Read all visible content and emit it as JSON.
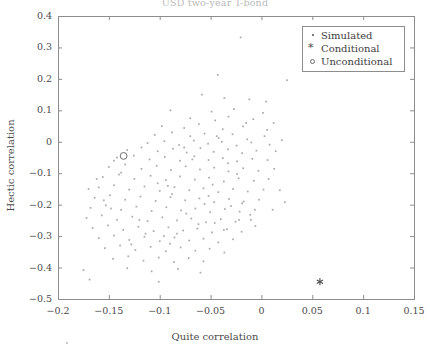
{
  "chart_data": {
    "type": "scatter",
    "title": "USD two-year T-bond",
    "xlabel": "Quite correlation",
    "ylabel": "Hectic correlation",
    "xlim": [
      -0.2,
      0.15
    ],
    "ylim": [
      -0.5,
      0.4
    ],
    "xticks": [
      -0.2,
      -0.15,
      -0.1,
      -0.05,
      0,
      0.05,
      0.1,
      0.15
    ],
    "xticklabels": [
      "−0.2",
      "−0.15",
      "−0.1",
      "−0.05",
      "0",
      "0.05",
      "0.1",
      "0.15"
    ],
    "yticks": [
      -0.5,
      -0.4,
      -0.3,
      -0.2,
      -0.1,
      0,
      0.1,
      0.2,
      0.3,
      0.4
    ],
    "yticklabels": [
      "−0.5",
      "−0.4",
      "−0.3",
      "−0.2",
      "−0.1",
      "0",
      "0.1",
      "0.2",
      "0.3",
      "0.4"
    ],
    "grid": false,
    "legend_position": "upper right",
    "legend": [
      "Simulated",
      "Conditional",
      "Unconditional"
    ],
    "series": [
      {
        "name": "Simulated",
        "marker": "point",
        "color": "#9a9a9a",
        "points": [
          [
            -0.0205,
            0.332
          ],
          [
            -0.043,
            0.213
          ],
          [
            0.025,
            0.196
          ],
          [
            -0.0585,
            0.15
          ],
          [
            -0.0365,
            0.139
          ],
          [
            -0.012,
            0.135
          ],
          [
            0.0045,
            0.128
          ],
          [
            -0.0895,
            0.1
          ],
          [
            -0.049,
            0.096
          ],
          [
            -0.027,
            0.104
          ],
          [
            0.0015,
            0.092
          ],
          [
            -0.07,
            0.075
          ],
          [
            -0.0455,
            0.068
          ],
          [
            -0.0325,
            0.08
          ],
          [
            -0.008,
            0.072
          ],
          [
            0.012,
            0.06
          ],
          [
            -0.098,
            0.05
          ],
          [
            -0.076,
            0.044
          ],
          [
            -0.0615,
            0.056
          ],
          [
            -0.038,
            0.04
          ],
          [
            -0.018,
            0.049
          ],
          [
            0.0055,
            0.038
          ],
          [
            -0.105,
            0.022
          ],
          [
            -0.088,
            0.03
          ],
          [
            -0.07,
            0.018
          ],
          [
            -0.056,
            0.026
          ],
          [
            -0.042,
            0.012
          ],
          [
            -0.0285,
            0.024
          ],
          [
            -0.014,
            0.008
          ],
          [
            0.003,
            0.018
          ],
          [
            0.02,
            0.005
          ],
          [
            -0.112,
            -0.004
          ],
          [
            -0.0955,
            0.002
          ],
          [
            -0.081,
            -0.01
          ],
          [
            -0.0665,
            0.004
          ],
          [
            -0.0525,
            -0.006
          ],
          [
            -0.039,
            0.0
          ],
          [
            -0.0245,
            -0.012
          ],
          [
            -0.01,
            -0.002
          ],
          [
            0.008,
            -0.009
          ],
          [
            -0.132,
            -0.026
          ],
          [
            -0.118,
            -0.018
          ],
          [
            -0.102,
            -0.03
          ],
          [
            -0.087,
            -0.022
          ],
          [
            -0.0735,
            -0.034
          ],
          [
            -0.06,
            -0.02
          ],
          [
            -0.047,
            -0.032
          ],
          [
            -0.033,
            -0.024
          ],
          [
            -0.019,
            -0.036
          ],
          [
            -0.005,
            -0.028
          ],
          [
            0.014,
            -0.03
          ],
          [
            -0.142,
            -0.05
          ],
          [
            -0.1255,
            -0.044
          ],
          [
            -0.11,
            -0.056
          ],
          [
            -0.095,
            -0.048
          ],
          [
            -0.08,
            -0.06
          ],
          [
            -0.066,
            -0.046
          ],
          [
            -0.052,
            -0.058
          ],
          [
            -0.038,
            -0.052
          ],
          [
            -0.024,
            -0.062
          ],
          [
            -0.009,
            -0.054
          ],
          [
            0.006,
            -0.058
          ],
          [
            -0.15,
            -0.08
          ],
          [
            -0.134,
            -0.072
          ],
          [
            -0.118,
            -0.086
          ],
          [
            -0.103,
            -0.076
          ],
          [
            -0.089,
            -0.09
          ],
          [
            -0.0745,
            -0.078
          ],
          [
            -0.0605,
            -0.088
          ],
          [
            -0.0465,
            -0.082
          ],
          [
            -0.0325,
            -0.094
          ],
          [
            -0.018,
            -0.084
          ],
          [
            -0.003,
            -0.092
          ],
          [
            0.0125,
            -0.086
          ],
          [
            -0.156,
            -0.112
          ],
          [
            -0.14,
            -0.104
          ],
          [
            -0.125,
            -0.118
          ],
          [
            -0.109,
            -0.108
          ],
          [
            -0.094,
            -0.122
          ],
          [
            -0.08,
            -0.11
          ],
          [
            -0.0655,
            -0.12
          ],
          [
            -0.0515,
            -0.114
          ],
          [
            -0.037,
            -0.126
          ],
          [
            -0.0225,
            -0.116
          ],
          [
            -0.0075,
            -0.124
          ],
          [
            0.007,
            -0.118
          ],
          [
            -0.16,
            -0.145
          ],
          [
            -0.145,
            -0.138
          ],
          [
            -0.13,
            -0.152
          ],
          [
            -0.115,
            -0.142
          ],
          [
            -0.1,
            -0.156
          ],
          [
            -0.0855,
            -0.144
          ],
          [
            -0.071,
            -0.154
          ],
          [
            -0.057,
            -0.148
          ],
          [
            -0.0425,
            -0.16
          ],
          [
            -0.028,
            -0.15
          ],
          [
            -0.0135,
            -0.158
          ],
          [
            0.002,
            -0.152
          ],
          [
            -0.164,
            -0.178
          ],
          [
            -0.149,
            -0.17
          ],
          [
            -0.134,
            -0.184
          ],
          [
            -0.119,
            -0.174
          ],
          [
            -0.104,
            -0.188
          ],
          [
            -0.0895,
            -0.176
          ],
          [
            -0.075,
            -0.186
          ],
          [
            -0.061,
            -0.18
          ],
          [
            -0.0465,
            -0.192
          ],
          [
            -0.032,
            -0.182
          ],
          [
            -0.0175,
            -0.19
          ],
          [
            -0.0025,
            -0.184
          ],
          [
            -0.168,
            -0.21
          ],
          [
            -0.153,
            -0.202
          ],
          [
            -0.138,
            -0.216
          ],
          [
            -0.123,
            -0.206
          ],
          [
            -0.108,
            -0.22
          ],
          [
            -0.0935,
            -0.208
          ],
          [
            -0.079,
            -0.218
          ],
          [
            -0.065,
            -0.212
          ],
          [
            -0.0505,
            -0.224
          ],
          [
            -0.036,
            -0.214
          ],
          [
            -0.0215,
            -0.222
          ],
          [
            -0.0065,
            -0.216
          ],
          [
            -0.172,
            -0.242
          ],
          [
            -0.157,
            -0.234
          ],
          [
            -0.142,
            -0.248
          ],
          [
            -0.127,
            -0.238
          ],
          [
            -0.112,
            -0.252
          ],
          [
            -0.0975,
            -0.24
          ],
          [
            -0.083,
            -0.25
          ],
          [
            -0.069,
            -0.244
          ],
          [
            -0.0545,
            -0.256
          ],
          [
            -0.04,
            -0.246
          ],
          [
            -0.0255,
            -0.254
          ],
          [
            -0.0105,
            -0.248
          ],
          [
            -0.166,
            -0.274
          ],
          [
            -0.151,
            -0.266
          ],
          [
            -0.136,
            -0.28
          ],
          [
            -0.121,
            -0.27
          ],
          [
            -0.106,
            -0.284
          ],
          [
            -0.0915,
            -0.272
          ],
          [
            -0.077,
            -0.282
          ],
          [
            -0.063,
            -0.276
          ],
          [
            -0.0485,
            -0.288
          ],
          [
            -0.034,
            -0.278
          ],
          [
            -0.0195,
            -0.286
          ],
          [
            -0.16,
            -0.306
          ],
          [
            -0.145,
            -0.298
          ],
          [
            -0.13,
            -0.312
          ],
          [
            -0.115,
            -0.302
          ],
          [
            -0.1,
            -0.316
          ],
          [
            -0.0855,
            -0.304
          ],
          [
            -0.071,
            -0.314
          ],
          [
            -0.057,
            -0.308
          ],
          [
            -0.0425,
            -0.32
          ],
          [
            -0.028,
            -0.31
          ],
          [
            -0.154,
            -0.338
          ],
          [
            -0.139,
            -0.33
          ],
          [
            -0.124,
            -0.344
          ],
          [
            -0.109,
            -0.334
          ],
          [
            -0.094,
            -0.348
          ],
          [
            -0.0795,
            -0.336
          ],
          [
            -0.065,
            -0.346
          ],
          [
            -0.051,
            -0.34
          ],
          [
            -0.0365,
            -0.352
          ],
          [
            -0.146,
            -0.372
          ],
          [
            -0.131,
            -0.364
          ],
          [
            -0.116,
            -0.378
          ],
          [
            -0.101,
            -0.368
          ],
          [
            -0.086,
            -0.382
          ],
          [
            -0.0715,
            -0.37
          ],
          [
            -0.057,
            -0.38
          ],
          [
            -0.175,
            -0.408
          ],
          [
            -0.132,
            -0.402
          ],
          [
            -0.108,
            -0.412
          ],
          [
            -0.082,
            -0.404
          ],
          [
            -0.06,
            -0.416
          ],
          [
            -0.169,
            -0.438
          ],
          [
            -0.101,
            -0.445
          ],
          [
            -0.019,
            -0.196
          ],
          [
            -0.011,
            -0.232
          ],
          [
            -0.006,
            -0.268
          ],
          [
            0.018,
            -0.154
          ],
          [
            0.023,
            -0.192
          ],
          [
            0.011,
            -0.216
          ],
          [
            -0.145,
            -0.06
          ],
          [
            -0.138,
            -0.098
          ],
          [
            -0.162,
            -0.118
          ],
          [
            -0.092,
            -0.14
          ],
          [
            -0.088,
            -0.166
          ],
          [
            -0.102,
            -0.132
          ],
          [
            -0.056,
            -0.198
          ],
          [
            -0.074,
            -0.228
          ],
          [
            -0.062,
            -0.262
          ],
          [
            -0.048,
            -0.136
          ],
          [
            -0.052,
            -0.172
          ],
          [
            -0.03,
            -0.204
          ],
          [
            -0.12,
            -0.248
          ],
          [
            -0.114,
            -0.292
          ],
          [
            -0.128,
            -0.326
          ],
          [
            -0.096,
            -0.3
          ],
          [
            -0.09,
            -0.324
          ],
          [
            -0.083,
            -0.292
          ],
          [
            -0.037,
            -0.28
          ],
          [
            -0.046,
            -0.258
          ],
          [
            -0.022,
            -0.248
          ],
          [
            -0.155,
            -0.186
          ],
          [
            -0.148,
            -0.212
          ],
          [
            -0.17,
            -0.15
          ],
          [
            -0.068,
            -0.056
          ],
          [
            -0.076,
            -0.018
          ],
          [
            -0.044,
            0.018
          ],
          [
            -0.015,
            0.06
          ],
          [
            -0.033,
            -0.068
          ],
          [
            -0.024,
            -0.102
          ]
        ]
      },
      {
        "name": "Conditional",
        "marker": "asterisk",
        "color": "#4b4b4b",
        "points": [
          [
            0.0575,
            -0.445
          ]
        ]
      },
      {
        "name": "Unconditional",
        "marker": "circle",
        "color": "#6d6d6d",
        "points": [
          [
            -0.1355,
            -0.045
          ]
        ]
      }
    ]
  }
}
